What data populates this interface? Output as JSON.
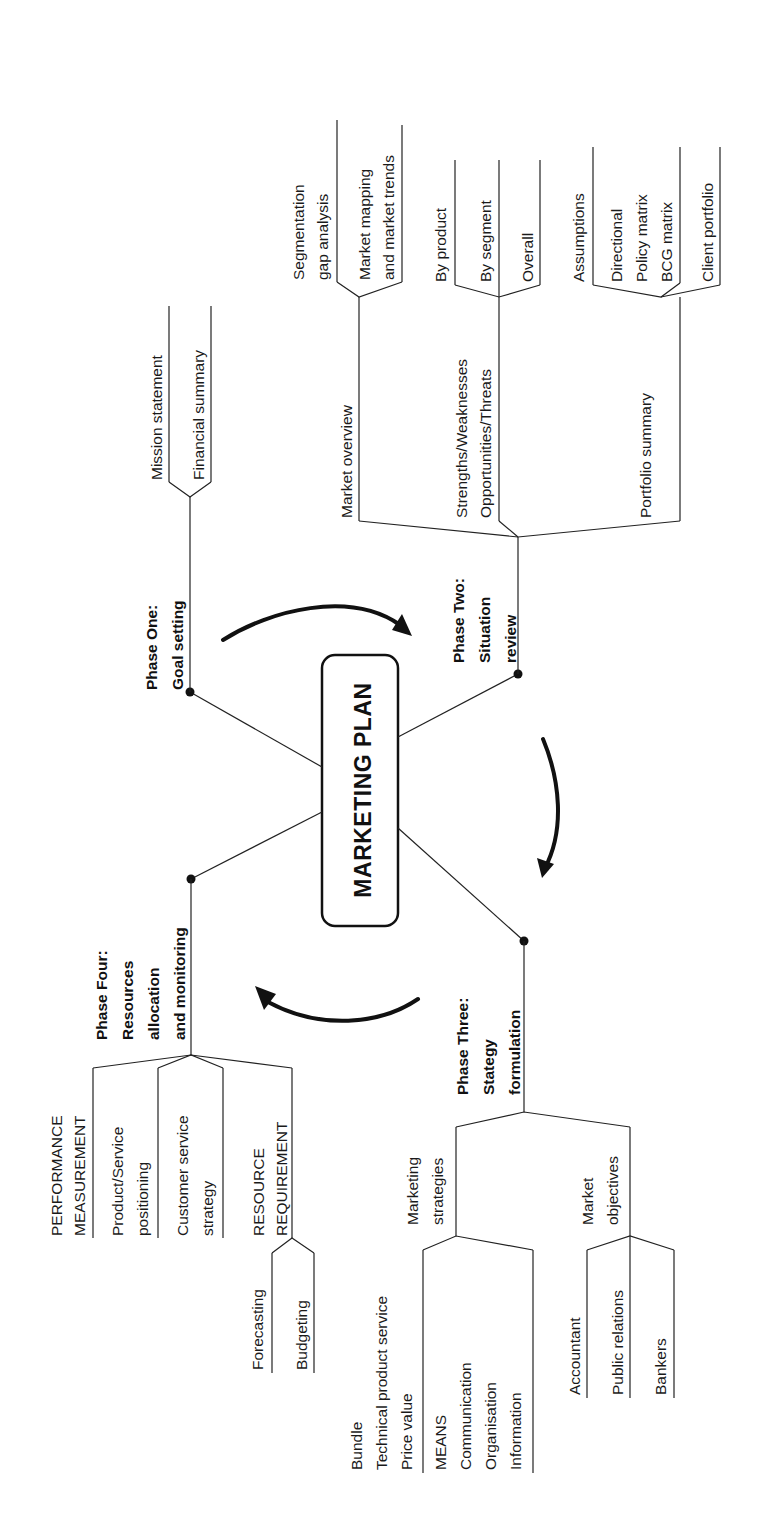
{
  "diagram": {
    "title": "MARKETING PLAN",
    "orientation": "rotated -90deg (text reads bottom-to-top)",
    "colors": {
      "ink": "#111111",
      "background": "#ffffff"
    },
    "phases": [
      {
        "id": "phase1",
        "lines": [
          "Phase One:",
          "Goal setting"
        ],
        "branches": [
          {
            "lines": [
              "Mission statement"
            ]
          },
          {
            "lines": [
              "Financial summary"
            ]
          }
        ]
      },
      {
        "id": "phase2",
        "lines": [
          "Phase Two:",
          "Situation",
          "review"
        ],
        "groups": [
          {
            "lines": [
              "Market overview"
            ],
            "branches": [
              {
                "lines": [
                  "Segmentation",
                  "gap analysis"
                ]
              },
              {
                "lines": [
                  "Market mapping",
                  "and market trends"
                ]
              }
            ]
          },
          {
            "lines": [
              "Strengths/Weaknesses",
              "Opportunities/Threats"
            ],
            "branches": [
              {
                "lines": [
                  "By product"
                ]
              },
              {
                "lines": [
                  "By segment"
                ]
              },
              {
                "lines": [
                  "Overall"
                ]
              }
            ]
          },
          {
            "lines": [
              "Portfolio summary"
            ],
            "branches": [
              {
                "lines": [
                  "Assumptions"
                ]
              },
              {
                "lines": [
                  "Directional",
                  "Policy matrix",
                  "BCG matrix"
                ]
              },
              {
                "lines": [
                  "Client portfolio"
                ]
              }
            ]
          }
        ]
      },
      {
        "id": "phase3",
        "lines": [
          "Phase Three:",
          "Stategy",
          "formulation"
        ],
        "groups": [
          {
            "lines": [
              "Marketing",
              "strategies"
            ],
            "branches": [
              {
                "lines": [
                  "Bundle",
                  "Technical product service",
                  "Price value"
                ]
              },
              {
                "lines": [
                  "MEANS",
                  "Communication",
                  "Organisation",
                  "Information"
                ]
              }
            ]
          },
          {
            "lines": [
              "Market",
              "objectives"
            ],
            "branches": [
              {
                "lines": [
                  "Accountant"
                ]
              },
              {
                "lines": [
                  "Public relations"
                ]
              },
              {
                "lines": [
                  "Bankers"
                ]
              }
            ]
          }
        ]
      },
      {
        "id": "phase4",
        "lines": [
          "Phase Four:",
          "Resources",
          "allocation",
          "and monitoring"
        ],
        "groups": [
          {
            "lines": [
              "PERFORMANCE",
              "MEASUREMENT"
            ]
          },
          {
            "lines": [
              "Product/Service",
              "positioning"
            ]
          },
          {
            "lines": [
              "Customer service",
              "strategy"
            ]
          },
          {
            "lines": [
              "RESOURCE",
              "REQUIREMENT"
            ],
            "branches": [
              {
                "lines": [
                  "Forecasting"
                ]
              },
              {
                "lines": [
                  "Budgeting"
                ]
              }
            ]
          }
        ]
      }
    ],
    "cycle_arrows": [
      "phase1-to-phase2",
      "phase2-to-phase3",
      "phase3-to-phase4"
    ]
  }
}
